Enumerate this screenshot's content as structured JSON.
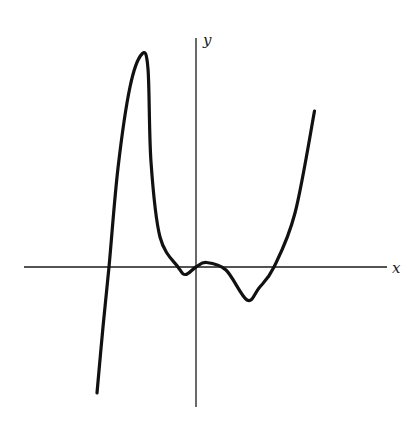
{
  "chart_data": {
    "type": "line",
    "title": "",
    "xlabel": "x",
    "ylabel": "y",
    "grid": false,
    "legend": "none",
    "xlim": [
      -6.3,
      6.4
    ],
    "ylim": [
      -4.9,
      7.7
    ],
    "series": [
      {
        "name": "f(x)",
        "points": [
          [
            -3.3,
            -4.2
          ],
          [
            -3.1,
            -2.0
          ],
          [
            -2.9,
            0.0
          ],
          [
            -2.6,
            3.3
          ],
          [
            -2.2,
            6.0
          ],
          [
            -1.8,
            7.1
          ],
          [
            -1.6,
            6.6
          ],
          [
            -1.5,
            3.5
          ],
          [
            -1.2,
            1.0
          ],
          [
            -0.6,
            0.0
          ],
          [
            -0.35,
            -0.25
          ],
          [
            0.0,
            0.0
          ],
          [
            0.35,
            0.15
          ],
          [
            1.0,
            -0.1
          ],
          [
            1.7,
            -1.1
          ],
          [
            2.1,
            -0.7
          ],
          [
            2.6,
            0.0
          ],
          [
            3.3,
            1.8
          ],
          [
            3.95,
            5.2
          ]
        ]
      }
    ],
    "features": {
      "roots": [
        -2.9,
        -0.6,
        0.0,
        0.9,
        2.6
      ],
      "local_maxima": [
        [
          -1.75,
          7.1
        ],
        [
          0.45,
          0.15
        ]
      ],
      "local_minima": [
        [
          -0.35,
          -0.25
        ],
        [
          1.7,
          -1.1
        ]
      ]
    }
  }
}
